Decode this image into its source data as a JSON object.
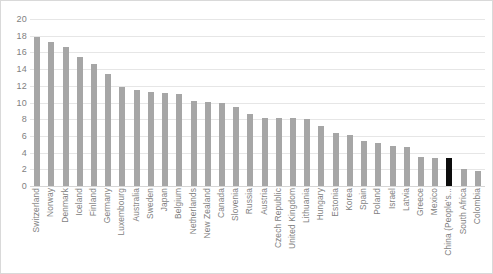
{
  "chart_data": {
    "type": "bar",
    "title": "",
    "subtitle": "",
    "xlabel": "",
    "ylabel": "",
    "ylim": [
      0,
      20
    ],
    "ytick_step": 2,
    "yticks": [
      20,
      18,
      16,
      14,
      12,
      10,
      8,
      6,
      4,
      2,
      0
    ],
    "grid": true,
    "legend": false,
    "bar_color": "#a6a6a6",
    "highlight_color": "#0d0d0d",
    "highlight_category": "China (People's...",
    "categories": [
      "Switzerland",
      "Norway",
      "Denmark",
      "Iceland",
      "Finland",
      "Germany",
      "Luxembourg",
      "Australia",
      "Sweden",
      "Japan",
      "Belgium",
      "Netherlands",
      "New Zealand",
      "Canada",
      "Slovenia",
      "Russia",
      "Austria",
      "Czech Republic",
      "United Kingdom",
      "Lithuania",
      "Hungary",
      "Estonia",
      "Korea",
      "Spain",
      "Poland",
      "Israel",
      "Latvia",
      "Greece",
      "Mexico",
      "China (People's...",
      "South Africa",
      "Colombia"
    ],
    "values": [
      17.9,
      17.3,
      16.7,
      15.4,
      14.6,
      13.4,
      11.9,
      11.5,
      11.3,
      11.1,
      11.0,
      10.2,
      10.1,
      10.0,
      9.5,
      8.6,
      8.1,
      8.1,
      8.1,
      8.0,
      7.2,
      6.3,
      6.1,
      5.4,
      5.2,
      4.8,
      4.7,
      3.5,
      3.4,
      3.3,
      2.0,
      1.8
    ]
  }
}
